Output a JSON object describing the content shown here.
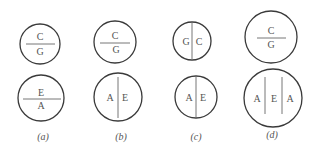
{
  "figure": {
    "panels": [
      {
        "caption": "(a)",
        "top": {
          "layout": "horizontal",
          "upper": "C",
          "lower": "G"
        },
        "bottom": {
          "layout": "horizontal",
          "upper": "E",
          "lower": "A"
        }
      },
      {
        "caption": "(b)",
        "top": {
          "layout": "horizontal",
          "upper": "C",
          "lower": "G"
        },
        "bottom": {
          "layout": "vertical",
          "left": "A",
          "right": "E"
        }
      },
      {
        "caption": "(c)",
        "top": {
          "layout": "vertical",
          "left": "G",
          "right": "C"
        },
        "bottom": {
          "layout": "vertical",
          "left": "A",
          "right": "E"
        }
      },
      {
        "caption": "(d)",
        "top": {
          "layout": "horizontal",
          "upper": "C",
          "lower": "G"
        },
        "bottom": {
          "layout": "vertical3",
          "left": "A",
          "middle": "E",
          "right": "A"
        }
      }
    ]
  }
}
